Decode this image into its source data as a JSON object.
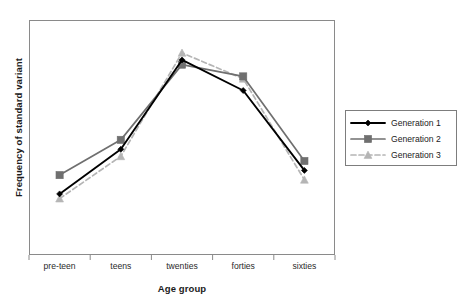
{
  "chart_data": {
    "type": "line",
    "title": "",
    "xlabel": "Age group",
    "ylabel": "Frequency of standard variant",
    "categories": [
      "pre-teen",
      "teens",
      "twenties",
      "forties",
      "sixties"
    ],
    "ylim": [
      0,
      100
    ],
    "y_ticks_shown": false,
    "grid": false,
    "legend_position": "right",
    "series": [
      {
        "name": "Generation 1",
        "color": "#000000",
        "marker": "diamond",
        "linestyle": "solid",
        "values": [
          26,
          45,
          83,
          70,
          36
        ]
      },
      {
        "name": "Generation 2",
        "color": "#6f6f6f",
        "marker": "square",
        "linestyle": "solid",
        "values": [
          34,
          49,
          81,
          76,
          40
        ]
      },
      {
        "name": "Generation 3",
        "color": "#b5b5b5",
        "marker": "triangle",
        "linestyle": "dashed",
        "values": [
          24,
          42,
          86,
          75,
          32
        ]
      }
    ]
  },
  "legend": {
    "items": [
      {
        "label": "Generation 1"
      },
      {
        "label": "Generation 2"
      },
      {
        "label": "Generation 3"
      }
    ]
  }
}
